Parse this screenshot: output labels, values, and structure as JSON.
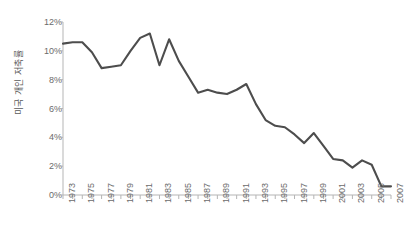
{
  "chart_data": {
    "type": "line",
    "title": "",
    "subtitle": "",
    "xlabel": "",
    "ylabel": "미국 개인 저축률",
    "ylim": [
      0,
      12
    ],
    "xlim": [
      1973,
      2007
    ],
    "grid": false,
    "legend": null,
    "y_tick_labels": [
      "12%",
      "10%",
      "8%",
      "6%",
      "4%",
      "2%",
      "0%"
    ],
    "y_tick_values": [
      12,
      10,
      8,
      6,
      4,
      2,
      0
    ],
    "y_tick_step": 2,
    "y_unit": "%",
    "x_tick_labels": [
      "1973",
      "1975",
      "1977",
      "1979",
      "1981",
      "1983",
      "1985",
      "1987",
      "1989",
      "1991",
      "1993",
      "1995",
      "1997",
      "1999",
      "2001",
      "2003",
      "2005",
      "2007"
    ],
    "x_tick_label_step": 2,
    "x_minor_tick_step": 1,
    "line_color": "#4d4d4d",
    "line_width": 2.1,
    "axis_color": "#b5b5b5",
    "tick_label_color": "#6b6b6b",
    "background_color": "#ffffff",
    "series": [
      {
        "name": "미국 개인 저축률",
        "x": [
          1973,
          1974,
          1975,
          1976,
          1977,
          1978,
          1979,
          1980,
          1981,
          1982,
          1983,
          1984,
          1985,
          1986,
          1987,
          1988,
          1989,
          1990,
          1991,
          1992,
          1993,
          1994,
          1995,
          1996,
          1997,
          1998,
          1999,
          2000,
          2001,
          2002,
          2003,
          2004,
          2005,
          2006,
          2007
        ],
        "values": [
          10.5,
          10.6,
          10.6,
          9.9,
          8.8,
          8.9,
          9.0,
          10.0,
          10.9,
          11.2,
          9.0,
          10.8,
          9.3,
          8.2,
          7.1,
          7.3,
          7.1,
          7.0,
          7.3,
          7.7,
          6.3,
          5.2,
          4.8,
          4.7,
          4.2,
          3.6,
          4.3,
          3.4,
          2.5,
          2.4,
          1.9,
          2.4,
          2.1,
          0.6,
          0.6
        ]
      }
    ],
    "annotations": []
  }
}
